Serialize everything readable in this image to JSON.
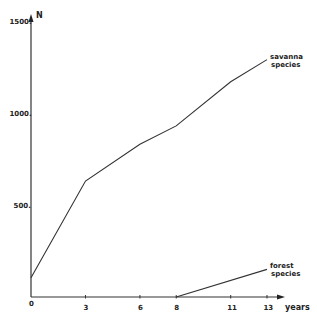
{
  "chart_data": {
    "type": "line",
    "title": "",
    "xlabel": "years",
    "ylabel": "N",
    "xlim": [
      0,
      13
    ],
    "ylim": [
      0,
      1500
    ],
    "grid": false,
    "legend": "inline labels at line ends",
    "x_ticks": [
      "0",
      "3",
      "6",
      "8",
      "11",
      "13"
    ],
    "y_ticks": [
      "500.",
      "1000.",
      "1500."
    ],
    "series": [
      {
        "name": "savanna species",
        "label_line1": "savanna",
        "label_line2": "species",
        "x": [
          0,
          3,
          6,
          8,
          11,
          13
        ],
        "values": [
          105,
          630,
          830,
          930,
          1170,
          1290
        ]
      },
      {
        "name": "forest species",
        "label_line1": "forest",
        "label_line2": "species",
        "x": [
          8,
          13
        ],
        "values": [
          0,
          150
        ]
      }
    ]
  },
  "axes": {
    "y_label": "N",
    "x_label": "years",
    "origin_label": "0"
  },
  "colors": {
    "line": "#333333",
    "text": "#222222",
    "background": "#ffffff"
  }
}
